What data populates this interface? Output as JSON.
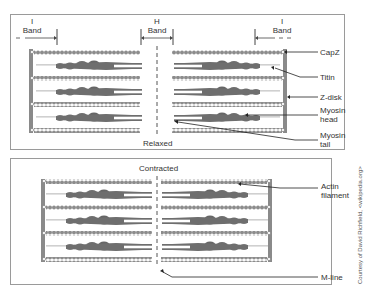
{
  "top_panel": {
    "state_label": "Relaxed",
    "band_labels": {
      "left_i": {
        "line1": "I",
        "line2": "Band"
      },
      "h": {
        "line1": "H",
        "line2": "Band"
      },
      "right_i": {
        "line1": "I",
        "line2": "Band"
      }
    },
    "callouts": [
      {
        "label": "CapZ"
      },
      {
        "label": "Titin"
      },
      {
        "label": "Z-disk"
      },
      {
        "label_line1": "Myosin",
        "label_line2": "head"
      },
      {
        "label_line1": "Myosin",
        "label_line2": "tail"
      }
    ]
  },
  "bottom_panel": {
    "state_label": "Contracted",
    "callouts": [
      {
        "label_line1": "Actin",
        "label_line2": "filament"
      },
      {
        "label": "M-line"
      }
    ]
  },
  "credit": "Courtesy of David Richfield, <wikipedia.org>",
  "colors": {
    "filament": "#8c8c8c",
    "myosin": "#6e6e6e",
    "zdisk": "#8a8a8a",
    "titin": "#cfcfcf",
    "border": "#9a9a9a",
    "text": "#333333"
  }
}
